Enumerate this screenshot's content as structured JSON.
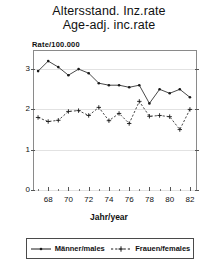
{
  "title": {
    "line1": "Altersstand. Inz.rate",
    "line2": "Age-adj. inc.rate"
  },
  "ylabel": "Rate/100.000",
  "legend": {
    "males_label": "Männer/males",
    "females_label": "Frauen/females"
  },
  "colors": {
    "males": "#1a1a1a",
    "females": "#1a1a1a",
    "grid": "#e2e2e2",
    "frame": "#8a8a8a",
    "text": "#111111"
  },
  "chart_data": {
    "type": "line",
    "xlabel": "Jahr/year",
    "ylabel": "Rate/100.000",
    "xlim": [
      66.6,
      82.6
    ],
    "ylim": [
      0,
      3.45
    ],
    "grid": true,
    "legend_position": "bottom",
    "xticks": [
      68,
      70,
      72,
      74,
      76,
      78,
      80,
      82
    ],
    "xtick_labels": [
      "68",
      "70",
      "72",
      "74",
      "76",
      "78",
      "80",
      "82"
    ],
    "yticks": [
      0,
      1,
      2,
      3
    ],
    "ytick_labels": [
      "0",
      "1",
      "2",
      "3"
    ],
    "x": [
      67,
      68,
      69,
      70,
      71,
      72,
      73,
      74,
      75,
      76,
      77,
      78,
      79,
      80,
      81,
      82
    ],
    "series": [
      {
        "name": "Männer/males",
        "linestyle": "solid",
        "marker": "dot",
        "values": [
          2.95,
          3.2,
          3.05,
          2.85,
          3.0,
          2.9,
          2.65,
          2.6,
          2.6,
          2.55,
          2.6,
          2.15,
          2.5,
          2.4,
          2.5,
          2.3
        ]
      },
      {
        "name": "Frauen/females",
        "linestyle": "dashed",
        "marker": "plus",
        "values": [
          1.8,
          1.7,
          1.73,
          1.95,
          1.97,
          1.85,
          2.05,
          1.72,
          1.9,
          1.65,
          2.2,
          1.83,
          1.85,
          1.82,
          1.5,
          2.0
        ]
      }
    ]
  }
}
